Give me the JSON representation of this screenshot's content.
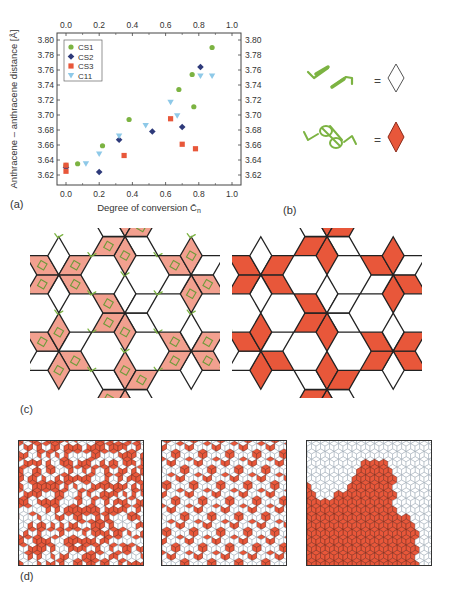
{
  "chart_data": [
    {
      "type": "scatter",
      "panel": "(a)",
      "title": "",
      "xlabel": "Degree of conversion C̄n",
      "xlabel_main": "Degree of conversion ",
      "xlabel_symbol": "C̄",
      "xlabel_sub": "n",
      "ylabel": "Anthracene – anthracene distance [Å]",
      "xlim": [
        -0.05,
        1.05
      ],
      "ylim": [
        3.61,
        3.81
      ],
      "xticks": [
        0.0,
        0.2,
        0.4,
        0.6,
        0.8,
        1.0
      ],
      "xtick_labels": [
        "0.0",
        "0.2",
        "0.4",
        "0.6",
        "0.8",
        "1.0"
      ],
      "yticks": [
        3.62,
        3.64,
        3.66,
        3.68,
        3.7,
        3.72,
        3.74,
        3.76,
        3.78,
        3.8
      ],
      "ytick_labels": [
        "3.62",
        "3.64",
        "3.66",
        "3.68",
        "3.70",
        "3.72",
        "3.74",
        "3.76",
        "3.78",
        "3.80"
      ],
      "grid": false,
      "mirror_axes": true,
      "legend_position": "upper left",
      "series": [
        {
          "name": "CS1",
          "marker": "circle",
          "color": "#7cb342",
          "x": [
            0.0,
            0.07,
            0.22,
            0.38,
            0.68,
            0.76,
            0.77,
            0.88
          ],
          "y": [
            3.633,
            3.635,
            3.659,
            3.694,
            3.734,
            3.754,
            3.711,
            3.79
          ]
        },
        {
          "name": "CS2",
          "marker": "diamond",
          "color": "#2e3a7a",
          "x": [
            0.0,
            0.2,
            0.32,
            0.52,
            0.7,
            0.81
          ],
          "y": [
            3.63,
            3.624,
            3.667,
            3.678,
            3.684,
            3.764
          ]
        },
        {
          "name": "CS3",
          "marker": "square",
          "color": "#e8573a",
          "x": [
            0.0,
            0.0,
            0.35,
            0.63,
            0.7,
            0.78
          ],
          "y": [
            3.633,
            3.625,
            3.646,
            3.695,
            3.661,
            3.655
          ]
        },
        {
          "name": "C11",
          "marker": "triangle-down",
          "color": "#8ec9e8",
          "x": [
            0.12,
            0.2,
            0.32,
            0.48,
            0.63,
            0.67,
            0.81,
            0.88
          ],
          "y": [
            3.635,
            3.648,
            3.672,
            3.686,
            3.717,
            3.699,
            3.752,
            3.752
          ]
        }
      ]
    }
  ],
  "panels": {
    "a": {
      "label": "(a)"
    },
    "b": {
      "label": "(b)",
      "rows": [
        {
          "description": "two separate anthracene-bearing strands",
          "equals": "=",
          "tile": "empty rhombus",
          "fill": "#ffffff"
        },
        {
          "description": "dimerized anthracene pair",
          "equals": "=",
          "tile": "filled rhombus",
          "fill": "#e8573a"
        }
      ]
    },
    "c": {
      "label": "(c)",
      "left_fill": "#f2a08f",
      "right_fill": "#e8573a",
      "stroke": "#222222",
      "strand_color": "#7cb342"
    },
    "d": {
      "label": "(d)",
      "fill": "#e8573a",
      "grid_color": "#9aa6b2",
      "panels": 3
    }
  },
  "colors": {
    "cs1": "#7cb342",
    "cs2": "#2e3a7a",
    "cs3": "#e8573a",
    "c11": "#8ec9e8",
    "tile_red": "#e8573a",
    "tile_pink": "#f2a08f"
  }
}
